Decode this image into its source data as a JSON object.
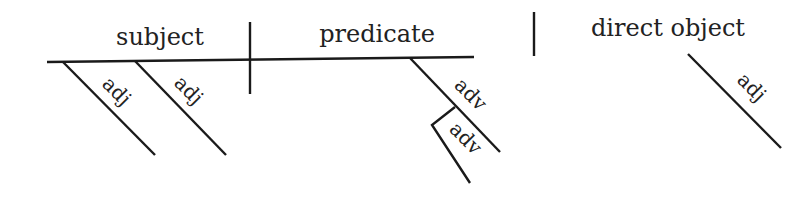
{
  "diagram": {
    "type": "sentence-diagram",
    "baseline": {
      "subject": "subject",
      "predicate": "predicate",
      "direct_object": "direct object"
    },
    "modifiers": {
      "subject_adj_1": "adj",
      "subject_adj_2": "adj",
      "predicate_adv": "adv",
      "adverb_modifier_adv": "adv",
      "object_adj": "adj"
    }
  }
}
